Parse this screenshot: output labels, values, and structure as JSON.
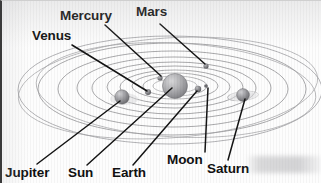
{
  "figure": {
    "kind": "solar-system-diagram",
    "caption_labels": [
      "Mercury",
      "Venus",
      "Mars",
      "Jupiter",
      "Sun",
      "Earth",
      "Moon",
      "Saturn"
    ],
    "colors": {
      "label_text": "#111111",
      "leader_line": "#141414",
      "orbit_line": "#8d8d90",
      "sun_body": "#a9a9ac",
      "planet_body": "#97979a",
      "page": "#fdfdfd",
      "border": "#3a3a3a"
    }
  },
  "labels": {
    "mercury": "Mercury",
    "venus": "Venus",
    "mars": "Mars",
    "jupiter": "Jupiter",
    "sun": "Sun",
    "earth": "Earth",
    "moon": "Moon",
    "saturn": "Saturn"
  },
  "bodies": [
    {
      "name": "Sun",
      "cx": 175,
      "cy": 86,
      "r": 12.5,
      "kind": "star"
    },
    {
      "name": "Mercury",
      "cx": 160,
      "cy": 78,
      "r": 2.6,
      "kind": "planet"
    },
    {
      "name": "Venus",
      "cx": 148,
      "cy": 92,
      "r": 3.0,
      "kind": "planet"
    },
    {
      "name": "Earth",
      "cx": 198,
      "cy": 89,
      "r": 3.2,
      "kind": "planet"
    },
    {
      "name": "Moon",
      "cx": 206,
      "cy": 86,
      "r": 1.8,
      "kind": "moon"
    },
    {
      "name": "Mars",
      "cx": 206,
      "cy": 66,
      "r": 2.6,
      "kind": "planet"
    },
    {
      "name": "Jupiter",
      "cx": 122,
      "cy": 97,
      "r": 7.2,
      "kind": "planet"
    },
    {
      "name": "Saturn",
      "cx": 243,
      "cy": 95,
      "r": 6.4,
      "kind": "ringed-planet"
    }
  ],
  "orbits": [
    {
      "name": "Mercury-orbit",
      "rx": 22,
      "ry": 7
    },
    {
      "name": "Venus-orbit",
      "rx": 32,
      "ry": 10
    },
    {
      "name": "Earth-orbit",
      "rx": 43,
      "ry": 13
    },
    {
      "name": "Mars-orbit",
      "rx": 55,
      "ry": 17
    },
    {
      "name": "Asteroid-belt",
      "rx": 68,
      "ry": 21
    },
    {
      "name": "Jupiter-orbit",
      "rx": 82,
      "ry": 26
    },
    {
      "name": "Saturn-orbit",
      "rx": 97,
      "ry": 31
    },
    {
      "name": "Uranus-orbit",
      "rx": 115,
      "ry": 38
    },
    {
      "name": "Neptune-orbit",
      "rx": 134,
      "ry": 46
    },
    {
      "name": "Pluto-orbit",
      "rx": 152,
      "ry": 54
    }
  ],
  "leader_lines": [
    {
      "name": "mercury-leader",
      "x1": 105,
      "y1": 25,
      "x2": 161,
      "y2": 76
    },
    {
      "name": "venus-leader",
      "x1": 72,
      "y1": 45,
      "x2": 147,
      "y2": 91
    },
    {
      "name": "mars-leader",
      "x1": 160,
      "y1": 24,
      "x2": 205,
      "y2": 64
    },
    {
      "name": "jupiter-leader",
      "x1": 37,
      "y1": 164,
      "x2": 120,
      "y2": 101
    },
    {
      "name": "sun-leader",
      "x1": 87,
      "y1": 165,
      "x2": 172,
      "y2": 88
    },
    {
      "name": "earth-leader",
      "x1": 133,
      "y1": 165,
      "x2": 197,
      "y2": 91
    },
    {
      "name": "moon-leader",
      "x1": 205,
      "y1": 152,
      "x2": 208,
      "y2": 88
    },
    {
      "name": "saturn-leader",
      "x1": 228,
      "y1": 160,
      "x2": 245,
      "y2": 99
    }
  ],
  "label_positions": {
    "mercury": {
      "left": 60,
      "top": 9
    },
    "venus": {
      "left": 32,
      "top": 29
    },
    "mars": {
      "left": 136,
      "top": 5
    },
    "jupiter": {
      "left": 5,
      "top": 166
    },
    "sun": {
      "left": 68,
      "top": 166
    },
    "earth": {
      "left": 112,
      "top": 166
    },
    "moon": {
      "left": 167,
      "top": 153
    },
    "saturn": {
      "left": 207,
      "top": 162
    }
  }
}
